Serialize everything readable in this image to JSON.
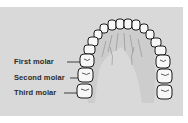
{
  "figure": {
    "labels": [
      {
        "id": "first",
        "text": "First molar"
      },
      {
        "id": "second",
        "text": "Second molar"
      },
      {
        "id": "third",
        "text": "Third molar"
      }
    ]
  },
  "colors": {
    "panel_background": "#d9d9d9",
    "tooth_fill": "#f7f7f7",
    "outline": "#1a1a1a",
    "label_text": "#2a2a2a"
  }
}
